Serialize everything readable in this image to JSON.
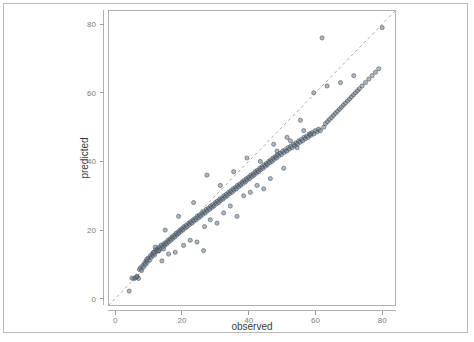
{
  "figure": {
    "background_color": "#ffffff",
    "frame_color": "#b9b9b9",
    "panel_border_color": "#b0b0b0",
    "point_fill_color": "#6b7c8c",
    "point_stroke_color": "#3f4a55",
    "reference_line_color": "#9d9d9d"
  },
  "axis": {
    "x_title": "observed",
    "y_title": "predicted",
    "x_ticks": [
      "0",
      "20",
      "40",
      "60",
      "80"
    ],
    "y_ticks": [
      "0",
      "20",
      "40",
      "60",
      "80"
    ]
  },
  "chart_data": {
    "type": "scatter",
    "title": "",
    "subtitle": "",
    "xlabel": "observed",
    "ylabel": "predicted",
    "xlim": [
      -2,
      84
    ],
    "ylim": [
      -2,
      84
    ],
    "xticks": [
      0,
      20,
      40,
      60,
      80
    ],
    "yticks": [
      0,
      20,
      40,
      60,
      80
    ],
    "grid": false,
    "legend": false,
    "legend_position": "none",
    "annotations": [
      {
        "kind": "reference-line",
        "description": "dashed 1:1 identity line y = x",
        "slope": 1,
        "intercept": 0,
        "style": "dashed"
      },
      {
        "kind": "outlier",
        "description": "point well above the identity line near observed 62",
        "x": 62.0,
        "y": 76.0
      }
    ],
    "series": [
      {
        "name": "observed vs predicted",
        "marker": "circle",
        "x": [
          4.2,
          5.0,
          5.6,
          6.1,
          6.6,
          7.0,
          7.3,
          7.6,
          7.9,
          8.2,
          8.5,
          8.8,
          9.0,
          9.3,
          9.6,
          9.9,
          10.2,
          10.5,
          10.8,
          11.0,
          11.3,
          11.6,
          11.9,
          12.1,
          12.4,
          12.7,
          13.0,
          13.2,
          13.5,
          13.8,
          14.0,
          14.3,
          14.6,
          14.9,
          15.2,
          15.5,
          15.8,
          16.1,
          16.4,
          16.7,
          17.0,
          17.3,
          17.6,
          17.9,
          18.2,
          18.5,
          18.8,
          19.1,
          19.4,
          19.7,
          20.0,
          20.3,
          20.6,
          21.0,
          21.3,
          21.6,
          22.0,
          22.3,
          22.6,
          23.0,
          23.3,
          23.6,
          24.0,
          24.3,
          24.6,
          25.0,
          25.3,
          25.6,
          26.0,
          26.3,
          26.6,
          27.0,
          27.3,
          27.6,
          28.0,
          28.3,
          28.6,
          29.0,
          29.3,
          29.6,
          30.0,
          30.3,
          30.6,
          31.0,
          31.3,
          31.6,
          32.0,
          32.3,
          32.6,
          33.0,
          33.3,
          33.6,
          34.0,
          34.3,
          34.6,
          35.0,
          35.3,
          35.6,
          36.0,
          36.3,
          36.6,
          37.0,
          37.3,
          37.6,
          38.0,
          38.3,
          38.6,
          39.0,
          39.3,
          39.6,
          40.0,
          40.3,
          40.6,
          41.0,
          41.3,
          41.6,
          42.0,
          42.3,
          42.6,
          43.0,
          43.3,
          43.6,
          44.0,
          44.3,
          44.6,
          45.0,
          45.3,
          45.6,
          46.0,
          46.3,
          46.6,
          47.0,
          47.3,
          47.6,
          48.0,
          48.3,
          48.6,
          49.0,
          49.4,
          49.8,
          50.2,
          50.6,
          51.0,
          51.4,
          51.8,
          52.2,
          52.6,
          53.0,
          53.4,
          53.8,
          54.2,
          54.6,
          55.0,
          55.4,
          55.8,
          56.2,
          56.6,
          57.0,
          57.4,
          57.8,
          58.2,
          58.6,
          59.0,
          59.5,
          60.0,
          60.5,
          61.0,
          61.5,
          62.0,
          62.5,
          63.0,
          63.6,
          64.2,
          64.8,
          65.4,
          66.0,
          66.6,
          67.2,
          67.8,
          68.4,
          69.0,
          69.6,
          70.2,
          70.8,
          71.4,
          72.0,
          72.6,
          73.2,
          74.0,
          75.0,
          76.0,
          77.0,
          78.0,
          79.0,
          80.0,
          12.0,
          13.0,
          14.5,
          16.0,
          18.0,
          20.5,
          22.5,
          24.5,
          26.5,
          26.8,
          28.5,
          30.5,
          32.5,
          34.5,
          36.5,
          38.5,
          40.5,
          42.5,
          44.5,
          46.5,
          48.5,
          50.5,
          52.5,
          54.5,
          56.5,
          58.5,
          6.5,
          9.5,
          11.5,
          15.0,
          19.0,
          23.5,
          27.5,
          31.5,
          35.5,
          39.5,
          43.5,
          47.5,
          51.5,
          55.5,
          59.5,
          63.5,
          67.5,
          71.5
        ],
        "y": [
          2.2,
          6.0,
          5.8,
          6.1,
          6.4,
          5.9,
          8.5,
          9.0,
          8.2,
          9.6,
          9.2,
          10.4,
          10.0,
          11.0,
          10.6,
          11.8,
          11.2,
          12.4,
          12.0,
          13.0,
          12.6,
          13.4,
          13.0,
          14.2,
          13.8,
          14.6,
          14.0,
          15.0,
          14.4,
          15.6,
          11.0,
          15.2,
          16.0,
          15.6,
          16.4,
          16.0,
          17.0,
          16.6,
          17.4,
          17.0,
          18.0,
          17.6,
          18.4,
          18.0,
          19.0,
          18.6,
          19.4,
          19.0,
          20.0,
          19.6,
          20.4,
          20.0,
          21.0,
          20.6,
          21.4,
          21.0,
          22.0,
          21.6,
          22.4,
          22.0,
          23.0,
          22.6,
          23.4,
          23.0,
          24.0,
          23.6,
          24.4,
          24.0,
          25.0,
          24.6,
          25.4,
          25.0,
          26.0,
          25.6,
          26.4,
          26.0,
          27.0,
          26.6,
          27.4,
          27.0,
          28.0,
          27.6,
          28.4,
          28.0,
          29.0,
          28.6,
          29.4,
          29.0,
          30.0,
          29.6,
          30.4,
          30.0,
          31.0,
          30.6,
          31.4,
          31.0,
          32.0,
          31.6,
          32.4,
          32.0,
          33.0,
          32.6,
          33.4,
          33.0,
          34.0,
          33.6,
          34.4,
          34.0,
          35.0,
          34.6,
          35.4,
          35.0,
          36.0,
          35.6,
          36.4,
          36.0,
          37.0,
          36.6,
          37.4,
          37.0,
          38.0,
          37.6,
          38.4,
          38.0,
          39.0,
          38.6,
          39.4,
          39.0,
          40.0,
          39.6,
          40.4,
          40.0,
          41.0,
          40.6,
          41.4,
          41.0,
          42.0,
          41.6,
          42.4,
          42.0,
          43.0,
          42.6,
          43.4,
          43.0,
          44.0,
          43.6,
          44.4,
          44.0,
          45.0,
          44.6,
          45.4,
          45.0,
          46.0,
          45.6,
          46.4,
          46.0,
          47.0,
          46.6,
          47.4,
          47.0,
          48.0,
          47.6,
          48.4,
          48.0,
          49.0,
          48.6,
          49.4,
          49.0,
          76.0,
          50.0,
          51.0,
          51.6,
          52.2,
          52.8,
          53.4,
          54.0,
          54.6,
          55.2,
          55.8,
          56.4,
          57.0,
          57.6,
          58.2,
          58.8,
          59.4,
          60.0,
          60.6,
          61.2,
          62.0,
          63.0,
          64.0,
          65.0,
          66.0,
          67.0,
          79.0,
          15.0,
          14.0,
          14.5,
          13.0,
          13.5,
          15.5,
          17.0,
          16.5,
          14.0,
          21.0,
          23.0,
          22.0,
          25.0,
          27.0,
          24.0,
          30.0,
          31.0,
          33.0,
          32.0,
          35.0,
          43.0,
          38.0,
          46.0,
          44.0,
          49.0,
          48.0,
          6.5,
          11.5,
          13.5,
          20.0,
          24.0,
          28.0,
          36.0,
          33.0,
          37.0,
          41.0,
          40.0,
          45.0,
          47.0,
          52.0,
          60.0,
          62.0,
          63.0,
          65.0
        ]
      }
    ]
  }
}
